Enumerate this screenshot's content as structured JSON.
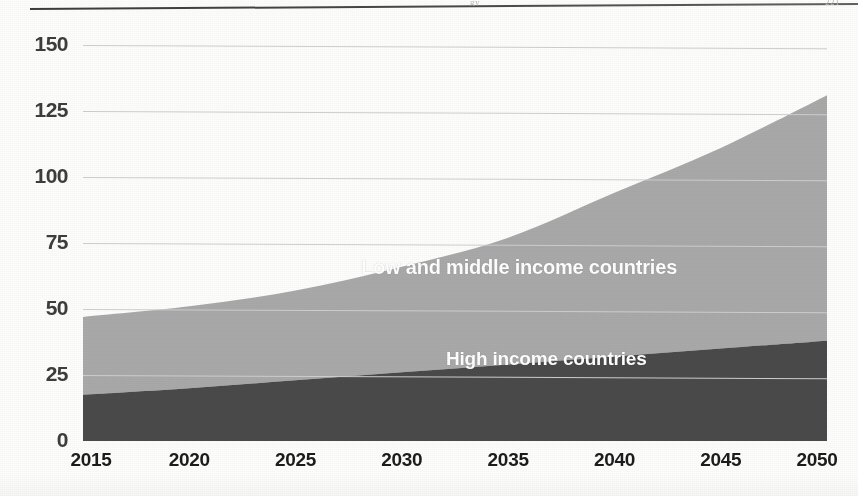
{
  "page": {
    "header_ghost_center": "gy",
    "header_ghost_right": "221"
  },
  "chart_data": {
    "type": "area",
    "stacked": true,
    "title": "",
    "subtitle": "",
    "xlabel": "",
    "ylabel": "",
    "xlim": [
      2015,
      2050
    ],
    "ylim": [
      0,
      150
    ],
    "ytick_labels": [
      "0",
      "25",
      "50",
      "75",
      "100",
      "125",
      "150"
    ],
    "yticks": [
      0,
      25,
      50,
      75,
      100,
      125,
      150
    ],
    "xtick_labels": [
      "2015",
      "2020",
      "2025",
      "2030",
      "2035",
      "2040",
      "2045",
      "2050"
    ],
    "xticks": [
      2015,
      2020,
      2025,
      2030,
      2035,
      2040,
      2045,
      2050
    ],
    "grid": "horizontal",
    "legend_position": "in-plot",
    "x": [
      2015,
      2020,
      2025,
      2030,
      2035,
      2040,
      2045,
      2050
    ],
    "series": [
      {
        "name": "High income countries",
        "color": "#4a4a4a",
        "values": [
          17.5,
          20,
          23,
          26,
          29,
          32,
          35,
          38
        ]
      },
      {
        "name": "Low and middle income countries",
        "color": "#a9a9a9",
        "values": [
          29.5,
          31,
          34,
          40,
          48,
          62,
          76,
          93
        ]
      }
    ],
    "totals": [
      47,
      51,
      57,
      66,
      77,
      94,
      111,
      131
    ],
    "annotations": [
      {
        "text": "Low and middle income countries",
        "series": "Low and middle income countries"
      },
      {
        "text": "High income countries",
        "series": "High income countries"
      }
    ],
    "colors": {
      "high_income": "#4a4a4a",
      "low_middle_income": "#a9a9a9",
      "gridline": "#cfcfcf",
      "axis_text": "#1c1c1c",
      "label_text": "#ffffff"
    }
  }
}
